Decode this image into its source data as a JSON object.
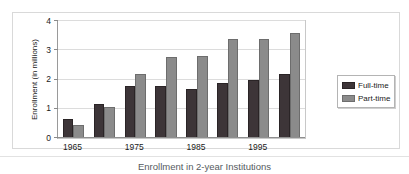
{
  "caption": "Enrollment in 2-year Institutions",
  "colors": {
    "full_time": "#3d3538",
    "part_time": "#8b8b8b",
    "grid": "#dcdcdc",
    "axis": "#8f8f8f",
    "frame": "#d9d9d9",
    "text": "#1a1a1a",
    "caption_text": "#555a60"
  },
  "legend": {
    "position": "right",
    "entries": [
      {
        "label": "Full-time",
        "swatch": "full-time"
      },
      {
        "label": "Part-time",
        "swatch": "part-time"
      }
    ]
  },
  "chart_data": {
    "type": "bar",
    "title": "Enrollment in 2-year Institutions",
    "xlabel": "",
    "ylabel": "Enrollment (in millions)",
    "ylim": [
      0,
      4
    ],
    "yticks": [
      0,
      1,
      2,
      3,
      4
    ],
    "ytick_labels": [
      "0",
      "1",
      "2",
      "3",
      "4"
    ],
    "grid": true,
    "grid_axis": "y",
    "legend_position": "right",
    "categories": [
      "1965",
      "1970",
      "1975",
      "1980",
      "1985",
      "1990",
      "1995",
      "2000"
    ],
    "visible_xtick_labels": [
      "1965",
      "1975",
      "1985",
      "1995"
    ],
    "visible_xtick_indices": [
      0,
      2,
      4,
      6
    ],
    "series": [
      {
        "name": "Full-time",
        "color": "#3d3538",
        "values": [
          0.65,
          1.18,
          1.78,
          1.79,
          1.66,
          1.88,
          1.99,
          2.19
        ]
      },
      {
        "name": "Part-time",
        "color": "#8b8b8b",
        "values": [
          0.45,
          1.07,
          2.18,
          2.78,
          2.79,
          3.39,
          3.39,
          3.6
        ]
      }
    ]
  }
}
